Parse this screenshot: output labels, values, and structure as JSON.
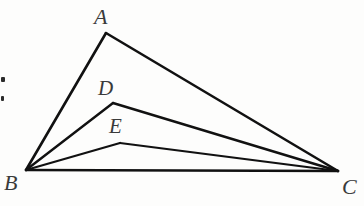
{
  "figure": {
    "name": "triangle-abc-with-cevians",
    "background_color": "#fdfdfc",
    "stroke_color": "#111111",
    "label_color": "#3a3a3a"
  },
  "labels": {
    "a": "A",
    "b": "B",
    "c": "C",
    "d": "D",
    "e": "E"
  },
  "label_positions": {
    "a": {
      "x": 94,
      "y": 6,
      "size": 22
    },
    "b": {
      "x": 4,
      "y": 172,
      "size": 22
    },
    "c": {
      "x": 342,
      "y": 176,
      "size": 22
    },
    "d": {
      "x": 98,
      "y": 78,
      "size": 21
    },
    "e": {
      "x": 109,
      "y": 116,
      "size": 21
    }
  },
  "points": {
    "A": {
      "x": 106,
      "y": 33
    },
    "B": {
      "x": 26,
      "y": 170
    },
    "C": {
      "x": 338,
      "y": 171
    },
    "D": {
      "x": 113,
      "y": 103
    },
    "E": {
      "x": 120,
      "y": 143
    }
  },
  "segments": [
    {
      "name": "segment-BA",
      "from": "B",
      "to": "A",
      "width": 2.6
    },
    {
      "name": "segment-AC",
      "from": "A",
      "to": "C",
      "width": 2.6
    },
    {
      "name": "segment-BC",
      "from": "B",
      "to": "C",
      "width": 2.6
    },
    {
      "name": "segment-BD",
      "from": "B",
      "to": "D",
      "width": 2.4
    },
    {
      "name": "segment-DC",
      "from": "D",
      "to": "C",
      "width": 2.4
    },
    {
      "name": "segment-BE",
      "from": "B",
      "to": "E",
      "width": 2.2
    },
    {
      "name": "segment-EC",
      "from": "E",
      "to": "C",
      "width": 2.2
    }
  ],
  "margin_marks": [
    {
      "name": "margin-speck-upper",
      "x": 1,
      "y": 77,
      "w": 4,
      "h": 5
    },
    {
      "name": "margin-speck-lower",
      "x": 1,
      "y": 96,
      "w": 3,
      "h": 5
    }
  ]
}
